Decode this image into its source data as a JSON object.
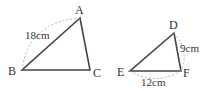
{
  "triangle_abc": {
    "vertices": {
      "A": "A",
      "B": "B",
      "C": "C"
    },
    "side_ab_length": "18cm"
  },
  "triangle_def": {
    "vertices": {
      "D": "D",
      "E": "E",
      "F": "F"
    },
    "side_df_length": "9cm",
    "side_ef_length": "12cm"
  },
  "colors": {
    "stroke": "#444444",
    "dashed": "#aaaaaa"
  }
}
